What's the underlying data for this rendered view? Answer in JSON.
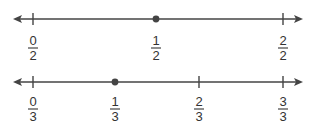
{
  "diagram": {
    "type": "number-lines",
    "color": "#444444",
    "number_lines": [
      {
        "name": "halves",
        "ticks": [
          {
            "x": 33,
            "numerator": "0",
            "denominator": "2"
          },
          {
            "x": 156,
            "numerator": "1",
            "denominator": "2",
            "point": true
          },
          {
            "x": 283,
            "numerator": "2",
            "denominator": "2"
          }
        ],
        "highlighted_point": "1/2"
      },
      {
        "name": "thirds",
        "ticks": [
          {
            "x": 33,
            "numerator": "0",
            "denominator": "3"
          },
          {
            "x": 115,
            "numerator": "1",
            "denominator": "3",
            "point": true
          },
          {
            "x": 199,
            "numerator": "2",
            "denominator": "3"
          },
          {
            "x": 283,
            "numerator": "3",
            "denominator": "3"
          }
        ],
        "highlighted_point": "1/3"
      }
    ]
  }
}
